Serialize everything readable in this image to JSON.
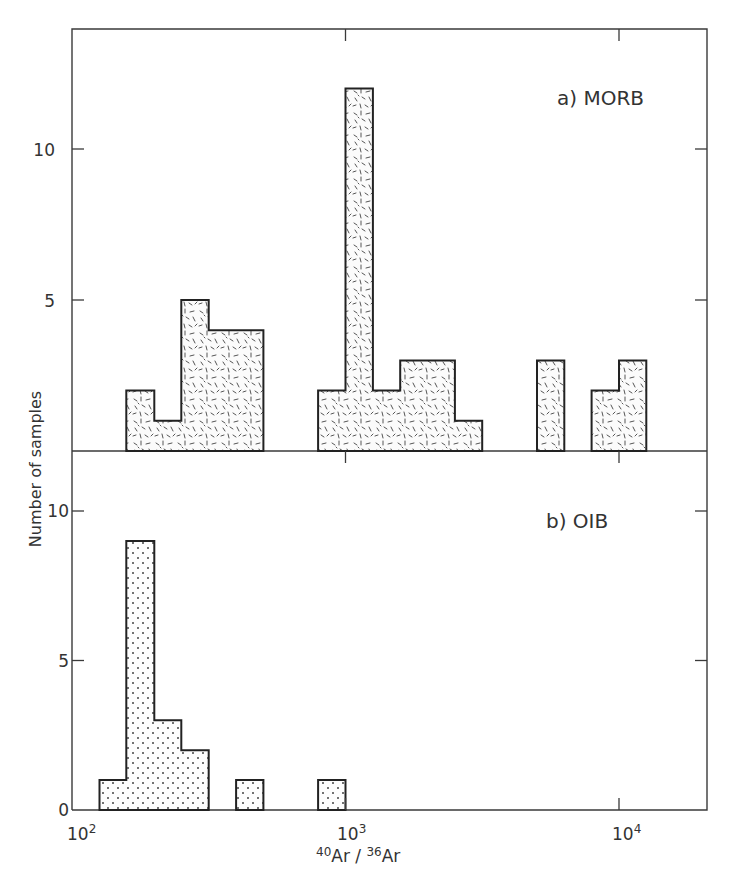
{
  "figure": {
    "ylabel": "Number of samples",
    "xlabel_parts": {
      "sup1": "40",
      "base1": "Ar",
      "slash": " / ",
      "sup2": "36",
      "base2": "Ar"
    },
    "x_tick_labels": [
      {
        "base": "10",
        "exp": "2"
      },
      {
        "base": "10",
        "exp": "3"
      },
      {
        "base": "10",
        "exp": "4"
      }
    ],
    "panels": [
      {
        "label": "a) MORB",
        "y_tick_labels": [
          "5",
          "10"
        ]
      },
      {
        "label": "b) OIB",
        "y_tick_labels": [
          "0",
          "5",
          "10"
        ]
      }
    ]
  },
  "chart_data": [
    {
      "type": "bar",
      "title": "a) MORB",
      "xlabel": "40Ar/36Ar",
      "ylabel": "Number of samples",
      "xscale": "log",
      "xlim": [
        100,
        22000
      ],
      "ylim": [
        0,
        13.5
      ],
      "yticks": [
        5,
        10
      ],
      "xticks": [
        "10^2",
        "10^3",
        "10^4"
      ],
      "fill_pattern": "dashes",
      "bins": [
        {
          "x0": 158,
          "x1": 200,
          "count": 2
        },
        {
          "x0": 200,
          "x1": 251,
          "count": 1
        },
        {
          "x0": 251,
          "x1": 316,
          "count": 5
        },
        {
          "x0": 316,
          "x1": 398,
          "count": 4
        },
        {
          "x0": 398,
          "x1": 501,
          "count": 4
        },
        {
          "x0": 794,
          "x1": 1000,
          "count": 2
        },
        {
          "x0": 1000,
          "x1": 1259,
          "count": 12
        },
        {
          "x0": 1259,
          "x1": 1585,
          "count": 2
        },
        {
          "x0": 1585,
          "x1": 1995,
          "count": 3
        },
        {
          "x0": 1995,
          "x1": 2512,
          "count": 3
        },
        {
          "x0": 2512,
          "x1": 3162,
          "count": 1
        },
        {
          "x0": 5012,
          "x1": 6310,
          "count": 3
        },
        {
          "x0": 7943,
          "x1": 10000,
          "count": 2
        },
        {
          "x0": 10000,
          "x1": 12589,
          "count": 3
        }
      ]
    },
    {
      "type": "bar",
      "title": "b) OIB",
      "xlabel": "40Ar/36Ar",
      "ylabel": "Number of samples",
      "xscale": "log",
      "xlim": [
        100,
        22000
      ],
      "ylim": [
        0,
        12
      ],
      "yticks": [
        0,
        5,
        10
      ],
      "xticks": [
        "10^2",
        "10^3",
        "10^4"
      ],
      "fill_pattern": "dots",
      "bins": [
        {
          "x0": 126,
          "x1": 158,
          "count": 1
        },
        {
          "x0": 158,
          "x1": 200,
          "count": 9
        },
        {
          "x0": 200,
          "x1": 251,
          "count": 3
        },
        {
          "x0": 251,
          "x1": 316,
          "count": 2
        },
        {
          "x0": 398,
          "x1": 501,
          "count": 1
        },
        {
          "x0": 794,
          "x1": 1000,
          "count": 1
        }
      ]
    }
  ]
}
